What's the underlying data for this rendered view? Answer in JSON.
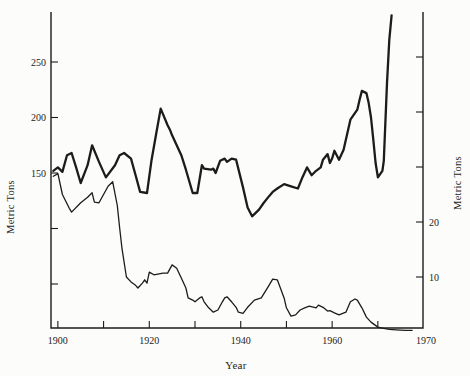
{
  "chart_data": {
    "type": "line",
    "title": "",
    "xlabel": "Year",
    "ylabel_left": "Metric Tons",
    "ylabel_right": "Metric Tons",
    "x_axis": {
      "min": 1900,
      "max": 1970,
      "ticks": [
        1900,
        1910,
        1920,
        1930,
        1940,
        1950,
        1960,
        1970
      ],
      "labeled_ticks": [
        1900,
        1920,
        1940,
        1960,
        1970
      ],
      "grid": false
    },
    "y_axis_left": {
      "ticks": [
        50,
        100,
        150,
        200,
        250
      ],
      "labeled_ticks": [
        150,
        200,
        250
      ],
      "range_approx": [
        10,
        295
      ]
    },
    "y_axis_right": {
      "ticks": [
        10,
        20,
        30,
        40,
        50
      ],
      "labeled_ticks": [
        10,
        20
      ],
      "range_approx": [
        0,
        59
      ]
    },
    "series": [
      {
        "name": "upper-series",
        "axis": "left",
        "points": [
          [
            1899,
            152
          ],
          [
            1900,
            155
          ],
          [
            1901,
            151
          ],
          [
            1902,
            166
          ],
          [
            1903,
            168
          ],
          [
            1904,
            155
          ],
          [
            1905,
            141
          ],
          [
            1906.5,
            157
          ],
          [
            1907.5,
            175
          ],
          [
            1909,
            160
          ],
          [
            1910.5,
            146
          ],
          [
            1912.5,
            157
          ],
          [
            1913.5,
            166
          ],
          [
            1914.5,
            168
          ],
          [
            1916,
            163
          ],
          [
            1917,
            148
          ],
          [
            1918,
            133
          ],
          [
            1919.5,
            132
          ],
          [
            1920.5,
            162
          ],
          [
            1921.5,
            185
          ],
          [
            1922.5,
            208
          ],
          [
            1924,
            193
          ],
          [
            1924.5,
            189
          ],
          [
            1925,
            184
          ],
          [
            1927,
            166
          ],
          [
            1928,
            153
          ],
          [
            1929.5,
            132
          ],
          [
            1930.5,
            132
          ],
          [
            1931.5,
            157
          ],
          [
            1932,
            154
          ],
          [
            1933.5,
            153
          ],
          [
            1934,
            154
          ],
          [
            1934.5,
            150
          ],
          [
            1935.5,
            161
          ],
          [
            1936.5,
            163
          ],
          [
            1937,
            160
          ],
          [
            1938,
            163
          ],
          [
            1939,
            162
          ],
          [
            1940.5,
            137
          ],
          [
            1941.5,
            119
          ],
          [
            1942.5,
            111
          ],
          [
            1944,
            117
          ],
          [
            1945,
            123
          ],
          [
            1946,
            128
          ],
          [
            1947,
            133
          ],
          [
            1948,
            136
          ],
          [
            1949.5,
            140
          ],
          [
            1951,
            138
          ],
          [
            1952.5,
            136
          ],
          [
            1953.5,
            146
          ],
          [
            1954.5,
            155
          ],
          [
            1955.5,
            148
          ],
          [
            1956.5,
            152
          ],
          [
            1957.5,
            155
          ],
          [
            1958,
            162
          ],
          [
            1959,
            167
          ],
          [
            1959.5,
            159
          ],
          [
            1960,
            163
          ],
          [
            1960.5,
            170
          ],
          [
            1961.5,
            162
          ],
          [
            1962.5,
            171
          ],
          [
            1964,
            198
          ],
          [
            1965.5,
            207
          ],
          [
            1966,
            216
          ],
          [
            1966.5,
            224
          ],
          [
            1967.5,
            222
          ],
          [
            1968,
            213
          ],
          [
            1968.5,
            200
          ],
          [
            1969,
            180
          ],
          [
            1969.5,
            159
          ],
          [
            1970,
            146
          ],
          [
            1971,
            152
          ],
          [
            1971.3,
            161
          ],
          [
            1972,
            231
          ],
          [
            1972.5,
            270
          ],
          [
            1973,
            292
          ]
        ]
      },
      {
        "name": "lower-series",
        "axis": "right",
        "points": [
          [
            1899,
            28.3
          ],
          [
            1900,
            28.8
          ],
          [
            1901,
            25
          ],
          [
            1902.5,
            22.5
          ],
          [
            1903,
            21.8
          ],
          [
            1905,
            23.5
          ],
          [
            1906.5,
            24.5
          ],
          [
            1907.5,
            25.3
          ],
          [
            1908,
            23.6
          ],
          [
            1909,
            23.5
          ],
          [
            1911,
            26.5
          ],
          [
            1912,
            27.3
          ],
          [
            1913,
            23
          ],
          [
            1913.5,
            19
          ],
          [
            1914,
            15.3
          ],
          [
            1915,
            10
          ],
          [
            1916,
            9.1
          ],
          [
            1917,
            8.5
          ],
          [
            1917.5,
            8
          ],
          [
            1918.5,
            8.9
          ],
          [
            1919,
            9.5
          ],
          [
            1919.5,
            8.9
          ],
          [
            1920,
            10.9
          ],
          [
            1921,
            10.4
          ],
          [
            1923,
            10.7
          ],
          [
            1924,
            10.7
          ],
          [
            1925,
            12.2
          ],
          [
            1926,
            11.6
          ],
          [
            1927,
            9.8
          ],
          [
            1928,
            8
          ],
          [
            1928.5,
            6.2
          ],
          [
            1929.5,
            5.8
          ],
          [
            1930,
            5.5
          ],
          [
            1931,
            6.2
          ],
          [
            1931.5,
            6.4
          ],
          [
            1932,
            5.5
          ],
          [
            1933,
            4.4
          ],
          [
            1934,
            3.6
          ],
          [
            1935,
            4
          ],
          [
            1936,
            5.5
          ],
          [
            1936.5,
            6.2
          ],
          [
            1937,
            6.4
          ],
          [
            1938,
            5.5
          ],
          [
            1939,
            4.5
          ],
          [
            1939.5,
            3.6
          ],
          [
            1940.5,
            3.4
          ],
          [
            1941.5,
            4.5
          ],
          [
            1943,
            5.8
          ],
          [
            1944.5,
            6.2
          ],
          [
            1946,
            8.2
          ],
          [
            1947,
            9.6
          ],
          [
            1948,
            9.5
          ],
          [
            1949.5,
            6.2
          ],
          [
            1950,
            4.4
          ],
          [
            1951,
            2.9
          ],
          [
            1952,
            3.1
          ],
          [
            1953,
            4
          ],
          [
            1954,
            4.4
          ],
          [
            1955,
            4.7
          ],
          [
            1956.5,
            4.4
          ],
          [
            1957,
            4.9
          ],
          [
            1958,
            4.5
          ],
          [
            1959,
            3.8
          ],
          [
            1959.5,
            3.9
          ],
          [
            1960.5,
            3.5
          ],
          [
            1961.5,
            3.1
          ],
          [
            1963,
            3.6
          ],
          [
            1964,
            5.5
          ],
          [
            1965,
            6
          ],
          [
            1965.5,
            5.8
          ],
          [
            1966.5,
            4.4
          ],
          [
            1967.5,
            2.7
          ],
          [
            1968.5,
            1.8
          ],
          [
            1970,
            0.9
          ],
          [
            1971,
            0.7
          ],
          [
            1972.5,
            0.5
          ],
          [
            1974,
            0.4
          ],
          [
            1976,
            0.3
          ],
          [
            1977.5,
            0.3
          ]
        ]
      }
    ],
    "colors": {
      "ink": "#1c1c1c",
      "background": "#fcfcfa"
    }
  }
}
